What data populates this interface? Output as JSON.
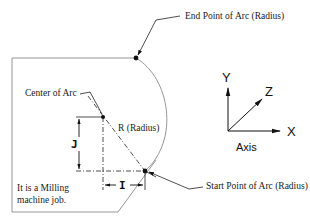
{
  "diagram": {
    "labels": {
      "end_point": "End Point of Arc (Radius)",
      "center": "Center of Arc",
      "radius": "R (Radius)",
      "start_point": "Start Point of Arc (Radius)",
      "note_line1": "It is a Milling",
      "note_line2": "machine job.",
      "dim_i": "I",
      "dim_j": "J"
    },
    "axis": {
      "caption": "Axis",
      "x": "X",
      "y": "Y",
      "z": "Z"
    },
    "points": {
      "end_point": {
        "x": 136,
        "y": 58
      },
      "center": {
        "x": 103,
        "y": 117
      },
      "start_point": {
        "x": 145,
        "y": 171
      }
    },
    "colors": {
      "outline": "#8a8a8a",
      "ink": "#111111"
    }
  }
}
